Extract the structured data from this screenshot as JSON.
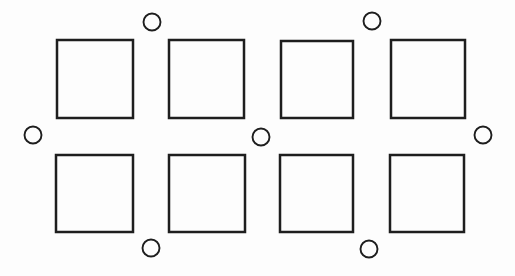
{
  "canvas": {
    "width": 515,
    "height": 276,
    "background_color": "#fdfdfd",
    "stroke_color": "#1e1e1e",
    "square_stroke_width": 2.5,
    "circle_stroke_width": 1.9
  },
  "diagram": {
    "squares": [
      {
        "name": "square-row1-col1",
        "x": 57,
        "y": 40,
        "w": 76,
        "h": 78
      },
      {
        "name": "square-row1-col2",
        "x": 169,
        "y": 40,
        "w": 75,
        "h": 78
      },
      {
        "name": "square-row1-col3",
        "x": 281,
        "y": 41,
        "w": 72,
        "h": 77
      },
      {
        "name": "square-row1-col4",
        "x": 391,
        "y": 40,
        "w": 74,
        "h": 78
      },
      {
        "name": "square-row2-col1",
        "x": 56,
        "y": 155,
        "w": 77,
        "h": 77
      },
      {
        "name": "square-row2-col2",
        "x": 169,
        "y": 155,
        "w": 76,
        "h": 77
      },
      {
        "name": "square-row2-col3",
        "x": 280,
        "y": 155,
        "w": 73,
        "h": 77
      },
      {
        "name": "square-row2-col4",
        "x": 390,
        "y": 155,
        "w": 74,
        "h": 77
      }
    ],
    "circles": [
      {
        "name": "circle-top-left",
        "cx": 152,
        "cy": 22,
        "r": 8.5
      },
      {
        "name": "circle-top-right",
        "cx": 372,
        "cy": 21,
        "r": 8.5
      },
      {
        "name": "circle-middle-left",
        "cx": 33,
        "cy": 135,
        "r": 8.5
      },
      {
        "name": "circle-middle-center",
        "cx": 261,
        "cy": 137,
        "r": 8.5
      },
      {
        "name": "circle-middle-right",
        "cx": 483,
        "cy": 135,
        "r": 8.5
      },
      {
        "name": "circle-bottom-left",
        "cx": 151,
        "cy": 248,
        "r": 8.5
      },
      {
        "name": "circle-bottom-right",
        "cx": 369,
        "cy": 249,
        "r": 8.5
      }
    ]
  }
}
